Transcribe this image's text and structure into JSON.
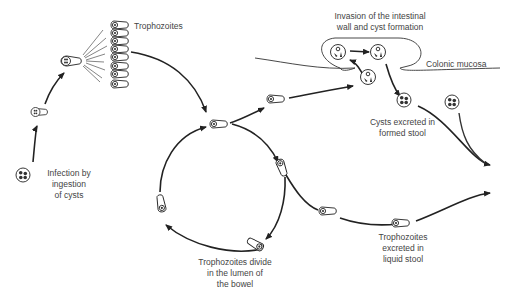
{
  "diagram": {
    "labels": {
      "trophozoites": "Trophozoites",
      "invasion": "Invasion of the intestinal\nwall and cyst formation",
      "colonic_mucosa": "Colonic mucosa",
      "cysts_excreted": "Cysts excreted in\nformed stool",
      "infection": "Infection by\ningestion\nof cysts",
      "divide": "Trophozoites divide\nin the lumen of\nthe bowel",
      "troph_excreted": "Trophozoites\nexcreted in\nliquid stool"
    },
    "colors": {
      "line": "#222222",
      "text": "#444444",
      "background": "#ffffff"
    }
  }
}
